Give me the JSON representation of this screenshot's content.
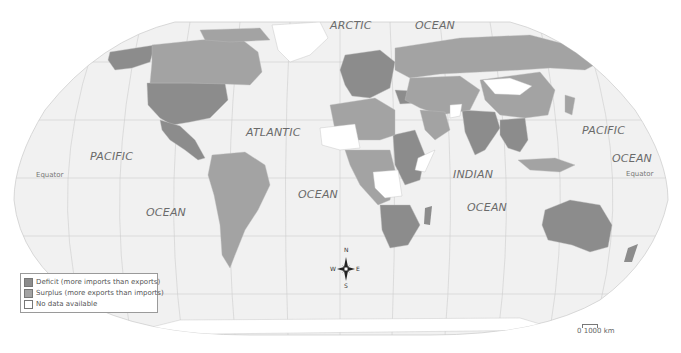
{
  "map": {
    "title": "World trade balance",
    "projection": "Robinson",
    "colors": {
      "ocean": "#f1f1f1",
      "graticule": "#c8c8c8",
      "deficit": "#8c8c8c",
      "surplus": "#a3a3a3",
      "no_data": "#ffffff",
      "border": "#bdbdbd"
    },
    "ocean_labels": {
      "arctic": "ARCTIC",
      "arctic_ocean": "OCEAN",
      "pacific_west": "PACIFIC",
      "pacific_west_ocean": "OCEAN",
      "atlantic": "ATLANTIC",
      "atlantic_ocean": "OCEAN",
      "indian": "INDIAN",
      "indian_ocean": "OCEAN",
      "pacific_east": "PACIFIC",
      "pacific_east_ocean": "OCEAN"
    },
    "equator_label_left": "Equator",
    "equator_label_right": "Equator"
  },
  "legend": {
    "items": [
      {
        "key": "deficit",
        "label": "Deficit (more imports than exports)",
        "color": "#8c8c8c"
      },
      {
        "key": "surplus",
        "label": "Surplus (more exports than imports)",
        "color": "#a3a3a3"
      },
      {
        "key": "no_data",
        "label": "No data available",
        "color": "#ffffff"
      }
    ]
  },
  "compass": {
    "n": "N",
    "s": "S",
    "e": "E",
    "w": "W"
  },
  "scale": {
    "label": "0  1000 km"
  }
}
